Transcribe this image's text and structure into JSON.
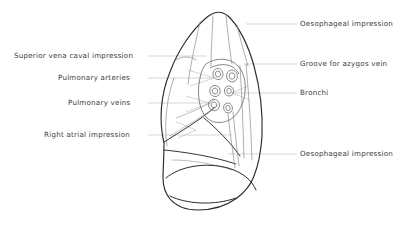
{
  "figure": {
    "background_color": "#ffffff",
    "outline_color": "#2b2b2b",
    "detail_color": "#8d8d8d",
    "leader_color": "#b4b4b4",
    "text_color": "#3a3a3a"
  },
  "labels": {
    "left": [
      {
        "id": "superior-vena-caval-impression",
        "text": "Superior vena caval impression",
        "x": 14,
        "y": 52,
        "leader_from_x": 148,
        "leader_from_y": 56,
        "leader_to_x": 205,
        "leader_to_y": 56
      },
      {
        "id": "pulmonary-arteries",
        "text": "Pulmonary arteries",
        "x": 58,
        "y": 74,
        "leader_from_x": 148,
        "leader_from_y": 78,
        "leader_to_x": 214,
        "leader_to_y": 78
      },
      {
        "id": "pulmonary-veins",
        "text": "Pulmonary veins",
        "x": 68,
        "y": 99,
        "leader_from_x": 148,
        "leader_from_y": 103,
        "leader_to_x": 210,
        "leader_to_y": 103
      },
      {
        "id": "right-atrial-impression",
        "text": "Right atrial impression",
        "x": 44,
        "y": 131,
        "leader_from_x": 148,
        "leader_from_y": 135,
        "leader_to_x": 232,
        "leader_to_y": 135
      }
    ],
    "right": [
      {
        "id": "oesophageal-impression-upper",
        "text": "Oesophageal impression",
        "x": 300,
        "y": 20,
        "leader_from_x": 246,
        "leader_from_y": 24,
        "leader_to_x": 297,
        "leader_to_y": 24
      },
      {
        "id": "groove-for-azygos-vein",
        "text": "Groove for azygos vein",
        "x": 300,
        "y": 60,
        "leader_from_x": 244,
        "leader_from_y": 64,
        "leader_to_x": 297,
        "leader_to_y": 64
      },
      {
        "id": "bronchi",
        "text": "Bronchi",
        "x": 300,
        "y": 89,
        "leader_from_x": 232,
        "leader_from_y": 93,
        "leader_to_x": 297,
        "leader_to_y": 93
      },
      {
        "id": "oesophageal-impression-lower",
        "text": "Oesophageal impression",
        "x": 300,
        "y": 150,
        "leader_from_x": 228,
        "leader_from_y": 154,
        "leader_to_x": 297,
        "leader_to_y": 154
      }
    ]
  },
  "hilum": {
    "structure_count": 6,
    "structures": [
      {
        "id": "hilar-oval-1",
        "cx": 218,
        "cy": 74,
        "rx": 5.0,
        "ry": 5.6,
        "rot": -15
      },
      {
        "id": "hilar-oval-2",
        "cx": 232,
        "cy": 76,
        "rx": 5.4,
        "ry": 6.0,
        "rot": -10
      },
      {
        "id": "hilar-oval-3",
        "cx": 215,
        "cy": 91,
        "rx": 5.2,
        "ry": 5.6,
        "rot": -20
      },
      {
        "id": "hilar-oval-4",
        "cx": 229,
        "cy": 91,
        "rx": 4.6,
        "ry": 5.0,
        "rot": -10
      },
      {
        "id": "hilar-oval-5",
        "cx": 214,
        "cy": 105,
        "rx": 5.4,
        "ry": 5.8,
        "rot": -25
      },
      {
        "id": "hilar-oval-6",
        "cx": 228,
        "cy": 108,
        "rx": 4.4,
        "ry": 5.0,
        "rot": -15
      }
    ]
  }
}
